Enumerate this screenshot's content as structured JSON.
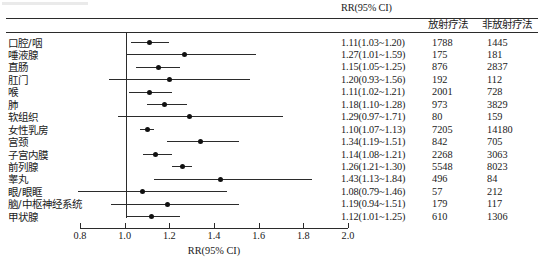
{
  "figure": {
    "type": "forest-plot",
    "axis_title": "RR(95% CI)"
  },
  "header": {
    "rr_label": "RR(95% CI)",
    "radiotherapy_label": "放射疗法",
    "non_radiotherapy_label": "非放射疗法"
  },
  "axis": {
    "ticks": [
      "0.8",
      "1.0",
      "1.2",
      "1.4",
      "1.6",
      "1.8",
      "2.0"
    ],
    "tick_values": [
      0.8,
      1.0,
      1.2,
      1.4,
      1.6,
      1.8,
      2.0
    ],
    "xmin": 0.8,
    "xmax": 2.0,
    "reference_line": 1.0,
    "label": "RR(95% CI)"
  },
  "chart_data": {
    "type": "forest",
    "title": "",
    "xlabel": "RR(95% CI)",
    "ylabel": "",
    "xlim": [
      0.8,
      2.0
    ],
    "reference_line": 1.0,
    "grid": false,
    "legend": "none",
    "columns": [
      "部位",
      "RR(95% CI)",
      "放射疗法",
      "非放射疗法"
    ],
    "rows": [
      {
        "category": "口腔/咽",
        "rr": 1.11,
        "lower": 1.03,
        "upper": 1.2,
        "rr_text": "1.11(1.03~1.20)",
        "radiotherapy": "1788",
        "non_radiotherapy": "1445"
      },
      {
        "category": "唾液腺",
        "rr": 1.27,
        "lower": 1.01,
        "upper": 1.59,
        "rr_text": "1.27(1.01~1.59)",
        "radiotherapy": "175",
        "non_radiotherapy": "181"
      },
      {
        "category": "直肠",
        "rr": 1.15,
        "lower": 1.05,
        "upper": 1.25,
        "rr_text": "1.15(1.05~1.25)",
        "radiotherapy": "876",
        "non_radiotherapy": "2837"
      },
      {
        "category": "肛门",
        "rr": 1.2,
        "lower": 0.93,
        "upper": 1.56,
        "rr_text": "1.20(0.93~1.56)",
        "radiotherapy": "192",
        "non_radiotherapy": "112"
      },
      {
        "category": "喉",
        "rr": 1.11,
        "lower": 1.02,
        "upper": 1.21,
        "rr_text": "1.11(1.02~1.21)",
        "radiotherapy": "2001",
        "non_radiotherapy": "728"
      },
      {
        "category": "肺",
        "rr": 1.18,
        "lower": 1.1,
        "upper": 1.28,
        "rr_text": "1.18(1.10~1.28)",
        "radiotherapy": "973",
        "non_radiotherapy": "3829"
      },
      {
        "category": "软组织",
        "rr": 1.29,
        "lower": 0.97,
        "upper": 1.71,
        "rr_text": "1.29(0.97~1.71)",
        "radiotherapy": "80",
        "non_radiotherapy": "159"
      },
      {
        "category": "女性乳房",
        "rr": 1.1,
        "lower": 1.07,
        "upper": 1.13,
        "rr_text": "1.10(1.07~1.13)",
        "radiotherapy": "7205",
        "non_radiotherapy": "14180"
      },
      {
        "category": "宫颈",
        "rr": 1.34,
        "lower": 1.19,
        "upper": 1.51,
        "rr_text": "1.34(1.19~1.51)",
        "radiotherapy": "842",
        "non_radiotherapy": "705"
      },
      {
        "category": "子宫内膜",
        "rr": 1.14,
        "lower": 1.08,
        "upper": 1.21,
        "rr_text": "1.14(1.08~1.21)",
        "radiotherapy": "2268",
        "non_radiotherapy": "3063"
      },
      {
        "category": "前列腺",
        "rr": 1.26,
        "lower": 1.21,
        "upper": 1.3,
        "rr_text": "1.26(1.21~1.30)",
        "radiotherapy": "5548",
        "non_radiotherapy": "8023"
      },
      {
        "category": "睾丸",
        "rr": 1.43,
        "lower": 1.13,
        "upper": 1.84,
        "rr_text": "1.43(1.13~1.84)",
        "radiotherapy": "496",
        "non_radiotherapy": "84"
      },
      {
        "category": "眼/眼眶",
        "rr": 1.08,
        "lower": 0.79,
        "upper": 1.46,
        "rr_text": "1.08(0.79~1.46)",
        "radiotherapy": "57",
        "non_radiotherapy": "212"
      },
      {
        "category": "脑/中枢神经系统",
        "rr": 1.19,
        "lower": 0.94,
        "upper": 1.51,
        "rr_text": "1.19(0.94~1.51)",
        "radiotherapy": "179",
        "non_radiotherapy": "117"
      },
      {
        "category": "甲状腺",
        "rr": 1.12,
        "lower": 1.01,
        "upper": 1.25,
        "rr_text": "1.12(1.01~1.25)",
        "radiotherapy": "610",
        "non_radiotherapy": "1306"
      }
    ]
  },
  "colors": {
    "ink": "#1a1a1a",
    "line": "#2b2b2b",
    "marker": "#111111",
    "background": "#ffffff"
  }
}
